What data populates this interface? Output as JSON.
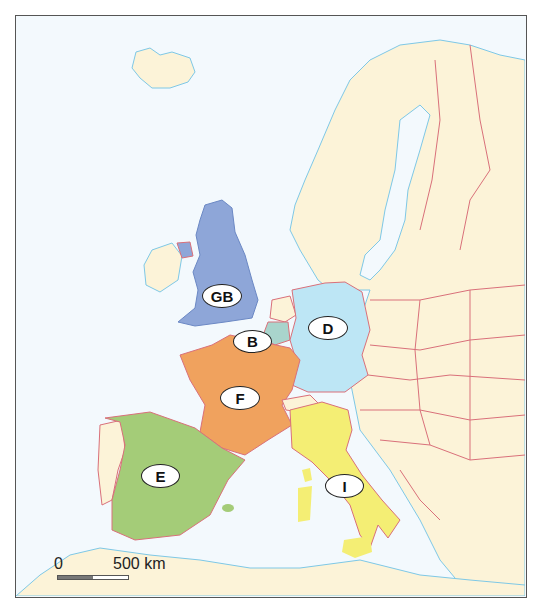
{
  "map": {
    "countries": [
      {
        "code": "GB",
        "name": "United Kingdom",
        "color": "#8ea6d8"
      },
      {
        "code": "B",
        "name": "Belgium",
        "color": "#a9d4cc"
      },
      {
        "code": "D",
        "name": "Germany",
        "color": "#bde6f5"
      },
      {
        "code": "F",
        "name": "France",
        "color": "#f0a25e"
      },
      {
        "code": "E",
        "name": "Spain",
        "color": "#a4cc78"
      },
      {
        "code": "I",
        "name": "Italy",
        "color": "#f4ee74"
      }
    ],
    "other_land_color": "#fcf3d8",
    "sea_color": "#f3f9fd",
    "border_color": "#d9707a",
    "coast_color": "#7ec8e6"
  },
  "labels": {
    "gb": "GB",
    "b": "B",
    "d": "D",
    "f": "F",
    "e": "E",
    "i": "I"
  },
  "scale": {
    "start": "0",
    "end": "500 km"
  }
}
